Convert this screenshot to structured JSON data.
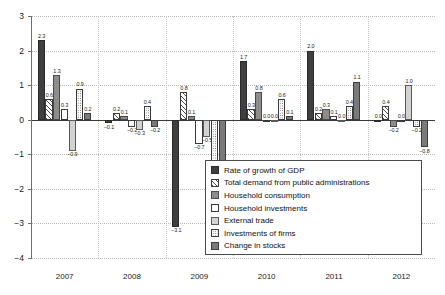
{
  "chart_data": {
    "type": "bar",
    "title": "",
    "subtitle": "",
    "xlabel": "",
    "ylabel": "",
    "ylim": [
      -4,
      3
    ],
    "yticks": [
      3,
      2,
      1,
      0,
      -1,
      -2,
      -3,
      -4
    ],
    "ytick_labels": [
      "3",
      "2",
      "1",
      "0",
      "−1",
      "−2",
      "−3",
      "−4"
    ],
    "grid": true,
    "legend_position": "lower-right",
    "categories": [
      "2007",
      "2008",
      "2009",
      "2010",
      "2011",
      "2012"
    ],
    "series": [
      {
        "name": "Rate of growth of GDP",
        "key": "gdp",
        "color": "#3f3f3f",
        "pattern": "solid",
        "values": [
          2.3,
          -0.1,
          -3.1,
          1.7,
          2.0,
          0.0
        ],
        "labels": [
          "2.3",
          "−0.1",
          "−3.1",
          "1.7",
          "2.0",
          "0.0"
        ]
      },
      {
        "name": "Total demand from public administrations",
        "key": "pubadmin",
        "color": "#ffffff",
        "pattern": "diagonal-hatch",
        "values": [
          0.6,
          0.2,
          0.8,
          0.3,
          0.2,
          0.4
        ],
        "labels": [
          "0.6",
          "0.2",
          "0.8",
          "0.3",
          "0.2",
          "0.4"
        ]
      },
      {
        "name": "Household consumption",
        "key": "hhcons",
        "color": "#8d8d8d",
        "pattern": "solid",
        "values": [
          1.3,
          0.1,
          0.1,
          0.8,
          0.3,
          -0.2
        ],
        "labels": [
          "1.3",
          "0.1",
          "0.1",
          "0.8",
          "0.3",
          "−0.2"
        ]
      },
      {
        "name": "Household investments",
        "key": "hhinv",
        "color": "#ffffff",
        "pattern": "open",
        "values": [
          0.3,
          -0.2,
          -0.7,
          0.0,
          0.1,
          0.0
        ],
        "labels": [
          "0.3",
          "−0.2",
          "−0.7",
          "0.0",
          "0.1",
          "0.0"
        ]
      },
      {
        "name": "External trade",
        "key": "exttrade",
        "color": "#d2d2d2",
        "pattern": "solid",
        "values": [
          -0.9,
          -0.3,
          -0.5,
          0.0,
          0.0,
          1.0
        ],
        "labels": [
          "−0.9",
          "−0.3",
          "−0.5",
          "0.0",
          "0.0",
          "1.0"
        ]
      },
      {
        "name": "Investments of firms",
        "key": "firminv",
        "color": "#fdfdfd",
        "pattern": "dotted",
        "values": [
          0.9,
          0.4,
          -1.6,
          0.6,
          0.4,
          -0.2
        ],
        "labels": [
          "0.9",
          "0.4",
          "−1.6",
          "0.6",
          "0.4",
          "−0.2"
        ]
      },
      {
        "name": "Change in stocks",
        "key": "stocks",
        "color": "#7a7a7a",
        "pattern": "solid",
        "values": [
          0.2,
          -0.2,
          -1.2,
          0.1,
          1.1,
          -0.8
        ],
        "labels": [
          "0.2",
          "−0.2",
          "−1.2",
          "0.1",
          "1.1",
          "−0.8"
        ]
      }
    ]
  },
  "legend": {
    "items": [
      {
        "label": "Rate of growth of GDP",
        "swatch": "s-gdp"
      },
      {
        "label": "Total demand from public administrations",
        "swatch": "s-pubadmin"
      },
      {
        "label": "Household consumption",
        "swatch": "s-hhcons"
      },
      {
        "label": "Household investments",
        "swatch": "s-hhinv"
      },
      {
        "label": "External trade",
        "swatch": "s-exttrade"
      },
      {
        "label": "Investments of firms",
        "swatch": "s-firminv"
      },
      {
        "label": "Change in stocks",
        "swatch": "s-stocks"
      }
    ]
  }
}
